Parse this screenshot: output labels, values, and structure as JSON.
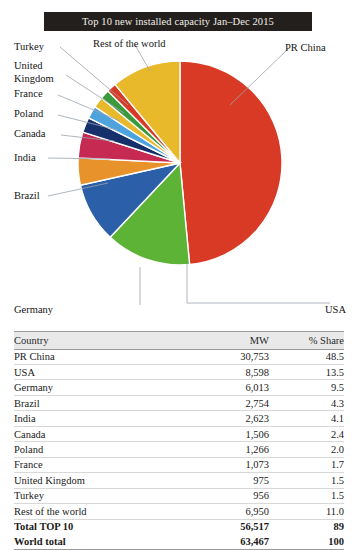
{
  "title": "Top 10 new installed capacity Jan–Dec 2015",
  "chart_data": {
    "type": "pie",
    "title": "Top 10 new installed capacity Jan–Dec 2015",
    "xlabel": "",
    "ylabel": "",
    "legend_position": "callout-labels",
    "value_unit": "MW",
    "share_unit": "%",
    "categories": [
      "PR China",
      "USA",
      "Germany",
      "Brazil",
      "India",
      "Canada",
      "Poland",
      "France",
      "United Kingdom",
      "Turkey",
      "Rest of the world"
    ],
    "values": [
      30753,
      8598,
      6013,
      2754,
      2623,
      1506,
      1266,
      1073,
      975,
      956,
      6950
    ],
    "shares": [
      48.5,
      13.5,
      9.5,
      4.3,
      4.1,
      2.4,
      2.0,
      1.7,
      1.5,
      1.5,
      11.0
    ],
    "colors": [
      "#D93A26",
      "#5CB335",
      "#2B5FA8",
      "#E8922B",
      "#C62A52",
      "#16306B",
      "#4FA3DC",
      "#E8B92B",
      "#3C9A3C",
      "#D93A26",
      "#E8B92B"
    ],
    "slices": [
      {
        "label": "PR China",
        "value": 30753,
        "share": 48.5,
        "color": "#D93A26"
      },
      {
        "label": "USA",
        "value": 8598,
        "share": 13.5,
        "color": "#5CB335"
      },
      {
        "label": "Germany",
        "value": 6013,
        "share": 9.5,
        "color": "#2B5FA8"
      },
      {
        "label": "Brazil",
        "value": 2754,
        "share": 4.3,
        "color": "#E8922B"
      },
      {
        "label": "India",
        "value": 2623,
        "share": 4.1,
        "color": "#C62A52"
      },
      {
        "label": "Canada",
        "value": 1506,
        "share": 2.4,
        "color": "#16306B"
      },
      {
        "label": "Poland",
        "value": 1266,
        "share": 2.0,
        "color": "#4FA3DC"
      },
      {
        "label": "France",
        "value": 1073,
        "share": 1.7,
        "color": "#E8B92B"
      },
      {
        "label": "United Kingdom",
        "value": 975,
        "share": 1.5,
        "color": "#3C9A3C"
      },
      {
        "label": "Turkey",
        "value": 956,
        "share": 1.5,
        "color": "#D93A26"
      },
      {
        "label": "Rest of the world",
        "value": 6950,
        "share": 11.0,
        "color": "#E8B92B"
      }
    ]
  },
  "callouts": {
    "turkey": "Turkey",
    "united_kingdom": "United\nKingdom",
    "united_kingdom_l1": "United",
    "united_kingdom_l2": "Kingdom",
    "france": "France",
    "poland": "Poland",
    "canada": "Canada",
    "india": "India",
    "brazil": "Brazil",
    "rest_of_the_world": "Rest of the world",
    "pr_china": "PR China",
    "germany": "Germany",
    "usa": "USA"
  },
  "table": {
    "columns": [
      "Country",
      "MW",
      "% Share"
    ],
    "rows": [
      {
        "country": "PR China",
        "mw": "30,753",
        "share": "48.5"
      },
      {
        "country": "USA",
        "mw": "8,598",
        "share": "13.5"
      },
      {
        "country": "Germany",
        "mw": "6,013",
        "share": "9.5"
      },
      {
        "country": "Brazil",
        "mw": "2,754",
        "share": "4.3"
      },
      {
        "country": "India",
        "mw": "2,623",
        "share": "4.1"
      },
      {
        "country": "Canada",
        "mw": "1,506",
        "share": "2.4"
      },
      {
        "country": "Poland",
        "mw": "1,266",
        "share": "2.0"
      },
      {
        "country": "France",
        "mw": "1,073",
        "share": "1.7"
      },
      {
        "country": "United Kingdom",
        "mw": "975",
        "share": "1.5"
      },
      {
        "country": "Turkey",
        "mw": "956",
        "share": "1.5"
      },
      {
        "country": "Rest of the world",
        "mw": "6,950",
        "share": "11.0"
      }
    ],
    "totals": [
      {
        "country": "Total TOP 10",
        "mw": "56,517",
        "share": "89"
      },
      {
        "country": "World total",
        "mw": "63,467",
        "share": "100"
      }
    ]
  }
}
